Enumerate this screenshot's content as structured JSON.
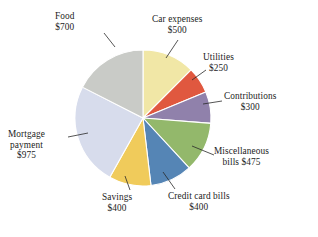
{
  "chart_data": {
    "type": "pie",
    "title": "",
    "currency": "$",
    "total": 4000,
    "start_angle_deg": 0,
    "direction": "clockwise",
    "center": {
      "x": 143,
      "y": 118
    },
    "radius": 68,
    "legend_position": "callout-labels",
    "grid": false,
    "categories": [
      "Car expenses",
      "Utilities",
      "Contributions",
      "Miscellaneous bills",
      "Credit card bills",
      "Savings",
      "Mortgage payment",
      "Food"
    ],
    "values": [
      500,
      250,
      300,
      475,
      400,
      400,
      975,
      700
    ],
    "colors": [
      "#f1e7a6",
      "#e0583f",
      "#9081ab",
      "#93b86b",
      "#5585b5",
      "#f0cb5b",
      "#d7dcec",
      "#c9cbc7"
    ],
    "slices": [
      {
        "label": "Car expenses",
        "value": 500,
        "value_text": "$500",
        "color": "#f1e7a6",
        "angle_deg": 45.0
      },
      {
        "label": "Utilities",
        "value": 250,
        "value_text": "$250",
        "color": "#e0583f",
        "angle_deg": 22.5
      },
      {
        "label": "Contributions",
        "value": 300,
        "value_text": "$300",
        "color": "#9081ab",
        "angle_deg": 27.0
      },
      {
        "label": "Miscellaneous bills",
        "value": 475,
        "value_text": "$475",
        "color": "#93b86b",
        "angle_deg": 42.75
      },
      {
        "label": "Credit card bills",
        "value": 400,
        "value_text": "$400",
        "color": "#5585b5",
        "angle_deg": 36.0
      },
      {
        "label": "Savings",
        "value": 400,
        "value_text": "$400",
        "color": "#f0cb5b",
        "angle_deg": 36.0
      },
      {
        "label": "Mortgage payment",
        "value": 975,
        "value_text": "$975",
        "color": "#d7dcec",
        "angle_deg": 87.75
      },
      {
        "label": "Food",
        "value": 700,
        "value_text": "$700",
        "color": "#c9cbc7",
        "angle_deg": 63.0
      }
    ]
  },
  "labels": {
    "food": {
      "line1": "Food",
      "line2": "$700"
    },
    "car": {
      "line1": "Car expenses",
      "line2": "$500"
    },
    "utilities": {
      "line1": "Utilities",
      "line2": "$250"
    },
    "contrib": {
      "line1": "Contributions",
      "line2": "$300"
    },
    "misc": {
      "line1": "Miscellaneous",
      "line2": "bills  $475"
    },
    "credit": {
      "line1": "Credit card bills",
      "line2": "$400"
    },
    "savings": {
      "line1": "Savings",
      "line2": "$400"
    },
    "mortgage": {
      "line1": "Mortgage",
      "line2": "payment",
      "line3": "$975"
    }
  }
}
